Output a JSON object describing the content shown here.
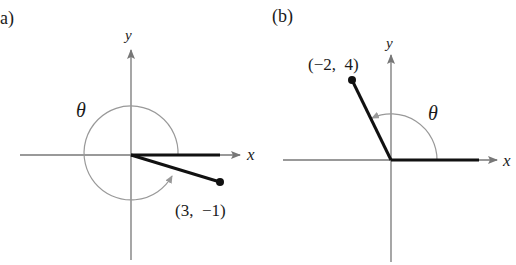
{
  "figure": {
    "panels": [
      {
        "label": "a)",
        "x_axis_label": "x",
        "y_axis_label": "y",
        "angle_label": "θ",
        "point_label": "(3,  −1)",
        "point": {
          "x": 3,
          "y": -1
        },
        "angle_direction": "counterclockwise, nearly full rotation"
      },
      {
        "label": "(b)",
        "x_axis_label": "x",
        "y_axis_label": "y",
        "angle_label": "θ",
        "point_label": "(−2,  4)",
        "point": {
          "x": -2,
          "y": 4
        },
        "angle_direction": "counterclockwise, second quadrant"
      }
    ],
    "colors": {
      "axis": "#777777",
      "ray": "#111111",
      "arc": "#999999",
      "text": "#1a1a1a"
    }
  }
}
